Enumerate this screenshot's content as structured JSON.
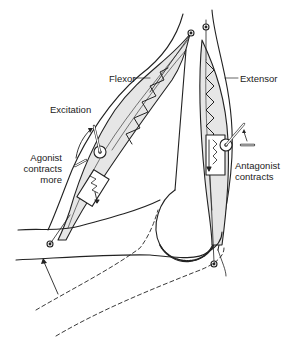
{
  "diagram": {
    "type": "anatomical-schematic",
    "labels": {
      "flexor": "Flexor",
      "extensor": "Extensor",
      "excitation": "Excitation",
      "agonist_line1": "Agonist",
      "agonist_line2": "contracts",
      "agonist_line3": "more",
      "antagonist_line1": "Antagonist",
      "antagonist_line2": "contracts"
    },
    "colors": {
      "stroke": "#222222",
      "muscle_fill": "#e6e6e6",
      "background": "#ffffff"
    }
  }
}
